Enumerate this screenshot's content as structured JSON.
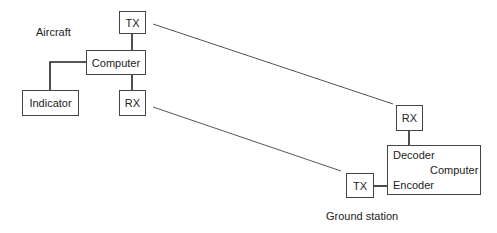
{
  "aircraft": {
    "label": "Aircraft",
    "tx": "TX",
    "computer": "Computer",
    "rx": "RX",
    "indicator": "Indicator"
  },
  "ground": {
    "label": "Ground station",
    "rx": "RX",
    "tx": "TX",
    "decoder": "Decoder",
    "computer": "Computer",
    "encoder": "Encoder"
  }
}
